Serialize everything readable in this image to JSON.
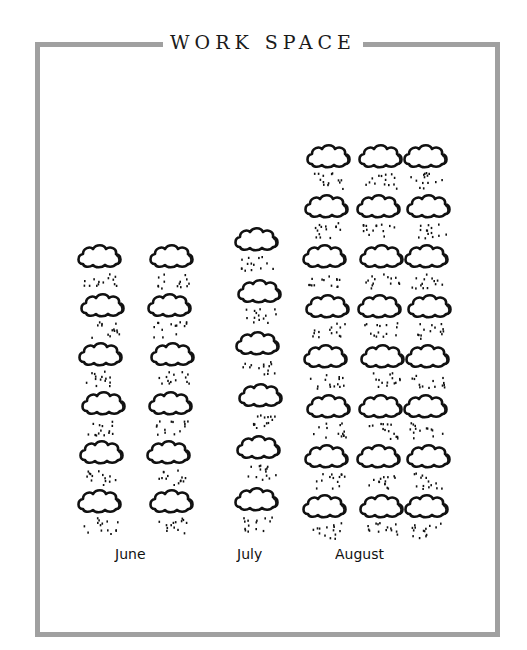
{
  "title": "WORK SPACE",
  "colors": {
    "border": "#a0a0a0",
    "ink": "#111111",
    "background": "#ffffff"
  },
  "icon": "rain-cloud-icon",
  "months": [
    {
      "label": "June",
      "count": 12,
      "columns": 2,
      "rows": 6
    },
    {
      "label": "July",
      "count": 6,
      "columns": 1,
      "rows": 6
    },
    {
      "label": "August",
      "count": 24,
      "columns": 3,
      "rows": 8
    }
  ],
  "chart_data": {
    "type": "bar",
    "subtype": "pictograph",
    "title": "WORK SPACE",
    "categories": [
      "June",
      "July",
      "August"
    ],
    "values": [
      12,
      6,
      24
    ],
    "unit_icon": "rain cloud",
    "xlabel": "",
    "ylabel": "",
    "grid": false,
    "legend": null
  }
}
